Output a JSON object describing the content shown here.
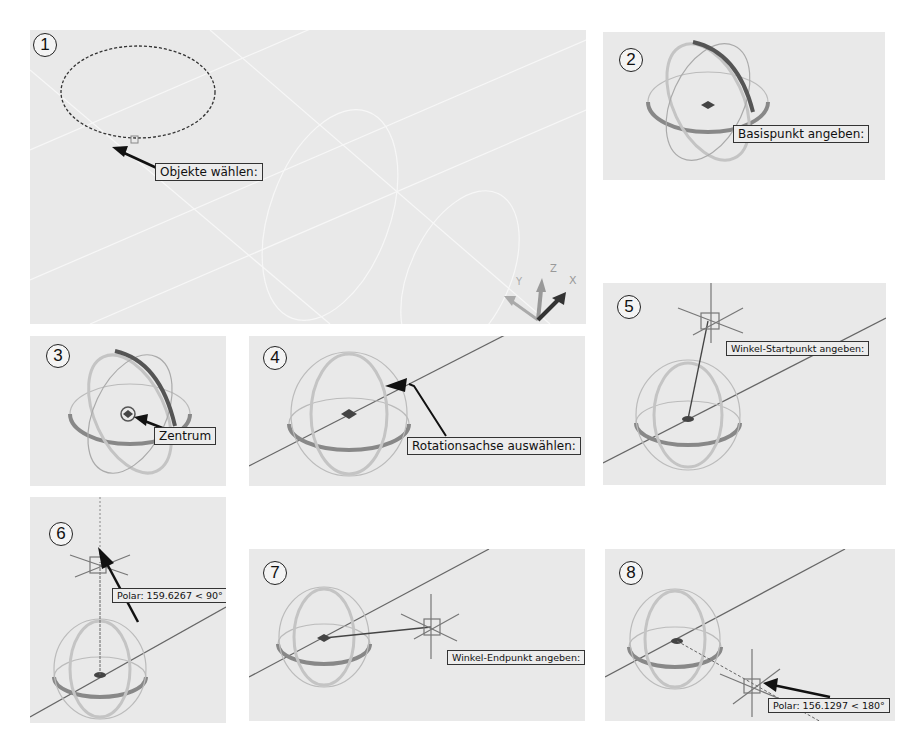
{
  "figure": {
    "panels": [
      {
        "step": "1",
        "tooltip": "Objekte wählen:"
      },
      {
        "step": "2",
        "tooltip": "Basispunkt angeben:"
      },
      {
        "step": "3",
        "tooltip": "Zentrum"
      },
      {
        "step": "4",
        "tooltip": "Rotationsachse auswählen:"
      },
      {
        "step": "5",
        "tooltip": "Winkel-Startpunkt angeben:"
      },
      {
        "step": "6",
        "tooltip": "Polar: 159.6267 < 90°"
      },
      {
        "step": "7",
        "tooltip": "Winkel-Endpunkt angeben:"
      },
      {
        "step": "8",
        "tooltip": "Polar: 156.1297 < 180°"
      }
    ],
    "ucs_icon": {
      "x_label": "X",
      "y_label": "Y",
      "z_label": "Z"
    }
  },
  "colors": {
    "panel_bg": "#e9e9e9",
    "gizmo_dark": "#555555",
    "gizmo_mid": "#8a8a8a",
    "gizmo_light": "#b9b9b9",
    "line": "#666666",
    "arrow": "#111111"
  }
}
